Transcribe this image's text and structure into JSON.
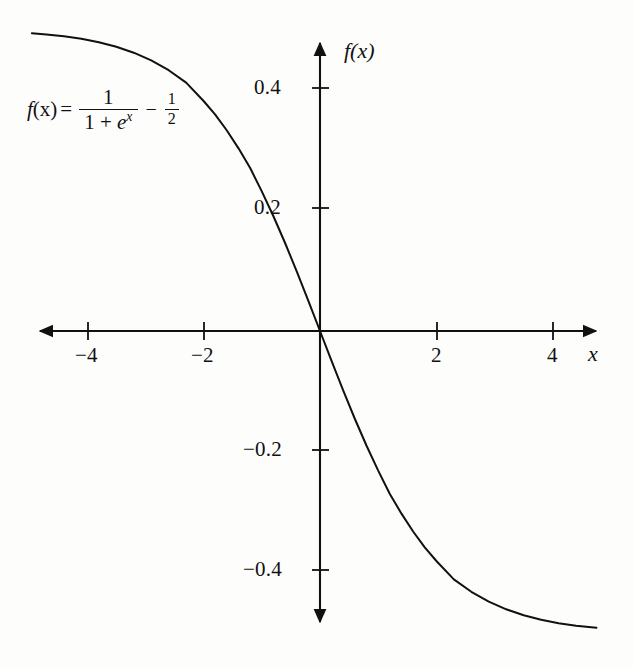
{
  "chart_data": {
    "type": "line",
    "title": "",
    "subtitle": "",
    "xlabel": "x",
    "ylabel": "f(x)",
    "xlim": [
      -4.95,
      4.75
    ],
    "ylim": [
      -0.5,
      0.5
    ],
    "grid": false,
    "legend": null,
    "annotation": {
      "expression": "f(x) = 1/(1 + e^x) - 1/2",
      "lhs": "f(x)",
      "equals": "=",
      "frac1_numerator": "1",
      "frac1_denominator": "1 + e",
      "frac1_denominator_exponent": "x",
      "operator": "−",
      "frac2_numerator": "1",
      "frac2_denominator": "2"
    },
    "x_ticks": [
      -4,
      -2,
      2,
      4
    ],
    "x_tick_labels": [
      "−4",
      "−2",
      "2",
      "4"
    ],
    "y_ticks": [
      0.4,
      0.2,
      -0.2,
      -0.4
    ],
    "y_tick_labels": [
      "0.4",
      "0.2",
      "−0.2",
      "−0.4"
    ],
    "series": [
      {
        "name": "f(x) = 1/(1 + e^x) - 1/2",
        "color": "#111111",
        "x": [
          -4.95,
          -4.7,
          -4.4,
          -4.1,
          -3.8,
          -3.5,
          -3.2,
          -2.9,
          -2.6,
          -2.3,
          -2.0,
          -1.8,
          -1.6,
          -1.4,
          -1.2,
          -1.0,
          -0.8,
          -0.6,
          -0.4,
          -0.2,
          0.0,
          0.2,
          0.4,
          0.6,
          0.8,
          1.0,
          1.2,
          1.4,
          1.6,
          1.8,
          2.0,
          2.3,
          2.6,
          2.9,
          3.2,
          3.5,
          3.8,
          4.1,
          4.4,
          4.75
        ],
        "y": [
          0.4929,
          0.4909,
          0.4879,
          0.4837,
          0.4781,
          0.4706,
          0.4608,
          0.448,
          0.4318,
          0.4112,
          0.3808,
          0.3581,
          0.332,
          0.3024,
          0.2699,
          0.2311,
          0.19,
          0.1457,
          0.0987,
          0.0498,
          0.0,
          -0.0498,
          -0.0987,
          -0.1457,
          -0.19,
          -0.2311,
          -0.2699,
          -0.3024,
          -0.332,
          -0.3581,
          -0.3808,
          -0.4112,
          -0.4318,
          -0.448,
          -0.4608,
          -0.4706,
          -0.4781,
          -0.4837,
          -0.4879,
          -0.4913
        ]
      }
    ]
  },
  "labels": {
    "y_axis_name": "f(x)",
    "x_axis_name": "x",
    "y_tick_04": "0.4",
    "y_tick_02": "0.2",
    "y_tick_n02": "−0.2",
    "y_tick_n04": "−0.4",
    "x_tick_n4": "−4",
    "x_tick_n2": "−2",
    "x_tick_2": "2",
    "x_tick_4": "4"
  },
  "formula": {
    "lhs": "f",
    "lhs_arg": "(x)",
    "equals": "=",
    "num1": "1",
    "den1a": "1 + ",
    "den1b": "e",
    "den1_exp": "x",
    "operator": "−",
    "num2": "1",
    "den2": "2"
  },
  "style": {
    "curve_color": "#111111",
    "axis_color": "#111111",
    "background": "#fdfdfc"
  }
}
